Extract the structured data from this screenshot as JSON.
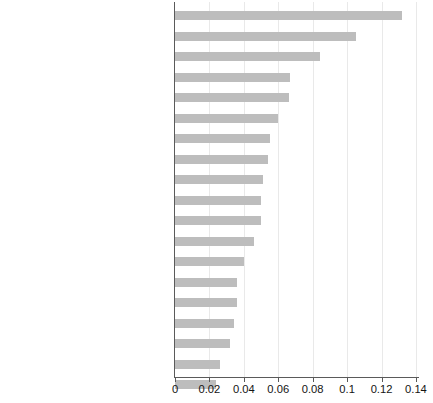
{
  "chart_data": {
    "type": "bar",
    "orientation": "horizontal",
    "title": "",
    "xlabel": "",
    "ylabel": "",
    "xlim": [
      0,
      0.145
    ],
    "xticks": [
      0,
      0.02,
      0.04,
      0.06,
      0.08,
      0.1,
      0.12,
      0.14
    ],
    "xtick_labels": [
      "0",
      "0.02",
      "0.04",
      "0.06",
      "0.08",
      "0.1",
      "0.12",
      "0.14"
    ],
    "grid": true,
    "legend": "none",
    "bar_color": "#bdbdbd",
    "categories": [
      "Digital business analysis",
      "Social Media skills",
      "Cognitive Flexibility",
      "Time management",
      "Cyber security and data protection",
      "Problem solving skills",
      "Ability to learn",
      "Situational skills",
      "Attitude",
      "Critical thinking",
      "Emotional intelligence",
      "Service focus",
      "Human skills",
      "Decision making skills",
      "Digital legislatives",
      "Coordination",
      "Creativity",
      "Negotiation skills",
      "Tolerance"
    ],
    "values": [
      0.132,
      0.105,
      0.084,
      0.067,
      0.066,
      0.06,
      0.055,
      0.054,
      0.051,
      0.05,
      0.05,
      0.046,
      0.04,
      0.036,
      0.036,
      0.034,
      0.032,
      0.026,
      0.024
    ]
  }
}
